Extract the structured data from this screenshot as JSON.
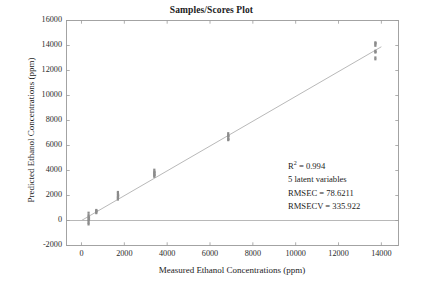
{
  "chart_data": {
    "type": "scatter",
    "title": "Samples/Scores Plot",
    "xlabel": "Measured Ethanol Concentrations (ppm)",
    "ylabel": "Predicted Ethanol Concentrations (ppm)",
    "xlim": [
      -700,
      14800
    ],
    "ylim": [
      -2000,
      16000
    ],
    "xticks": [
      0,
      2000,
      4000,
      6000,
      8000,
      10000,
      12000,
      14000
    ],
    "xtick_labels": [
      "0",
      "2000",
      "4000",
      "6000",
      "8000",
      "10000",
      "12000",
      "14000"
    ],
    "yticks": [
      -2000,
      0,
      2000,
      4000,
      6000,
      8000,
      10000,
      12000,
      14000,
      16000
    ],
    "ytick_labels": [
      "-2000",
      "0",
      "2000",
      "4000",
      "6000",
      "8000",
      "10000",
      "12000",
      "14000",
      "16000"
    ],
    "grid": false,
    "legend": null,
    "marker_color": "#8c8c8c",
    "fit_line_color": "#b9b9b9",
    "zero_line_color": "#b0b0b0",
    "axis_color": "#9a9a9a",
    "fit_line": {
      "description": "1:1 regression fit line",
      "x1": 0,
      "y1": 0,
      "x2": 14000,
      "y2": 13900
    },
    "zero_line": {
      "y": 0,
      "x_start": -700,
      "x_end": 14800
    },
    "series": [
      {
        "name": "Samples",
        "points": [
          {
            "x": 330,
            "y": 620
          },
          {
            "x": 330,
            "y": 430
          },
          {
            "x": 330,
            "y": 300
          },
          {
            "x": 330,
            "y": 170
          },
          {
            "x": 330,
            "y": 60
          },
          {
            "x": 330,
            "y": -60
          },
          {
            "x": 330,
            "y": -190
          },
          {
            "x": 330,
            "y": -310
          },
          {
            "x": 350,
            "y": 250
          },
          {
            "x": 350,
            "y": 90
          },
          {
            "x": 690,
            "y": 840
          },
          {
            "x": 690,
            "y": 740
          },
          {
            "x": 690,
            "y": 660
          },
          {
            "x": 690,
            "y": 590
          },
          {
            "x": 700,
            "y": 780
          },
          {
            "x": 1700,
            "y": 2280
          },
          {
            "x": 1700,
            "y": 2150
          },
          {
            "x": 1700,
            "y": 2000
          },
          {
            "x": 1700,
            "y": 1880
          },
          {
            "x": 1700,
            "y": 1780
          },
          {
            "x": 1700,
            "y": 1680
          },
          {
            "x": 1710,
            "y": 2060
          },
          {
            "x": 1710,
            "y": 1920
          },
          {
            "x": 3400,
            "y": 4060
          },
          {
            "x": 3400,
            "y": 3920
          },
          {
            "x": 3400,
            "y": 3800
          },
          {
            "x": 3400,
            "y": 3700
          },
          {
            "x": 3400,
            "y": 3600
          },
          {
            "x": 3400,
            "y": 3500
          },
          {
            "x": 3410,
            "y": 3860
          },
          {
            "x": 3410,
            "y": 3650
          },
          {
            "x": 6850,
            "y": 6980
          },
          {
            "x": 6850,
            "y": 6840
          },
          {
            "x": 6850,
            "y": 6700
          },
          {
            "x": 6850,
            "y": 6560
          },
          {
            "x": 6850,
            "y": 6430
          },
          {
            "x": 6860,
            "y": 6760
          },
          {
            "x": 6860,
            "y": 6500
          },
          {
            "x": 13720,
            "y": 14250
          },
          {
            "x": 13720,
            "y": 14100
          },
          {
            "x": 13720,
            "y": 13980
          },
          {
            "x": 13720,
            "y": 13580
          },
          {
            "x": 13720,
            "y": 13440
          },
          {
            "x": 13720,
            "y": 13040
          },
          {
            "x": 13720,
            "y": 12900
          },
          {
            "x": 13730,
            "y": 14180
          },
          {
            "x": 13730,
            "y": 13500
          }
        ]
      }
    ],
    "annotations": {
      "r2_prefix": "R",
      "r2_exponent": "2",
      "r2_value": " = 0.994",
      "latent_variables": "5 latent variables",
      "rmsec": "RMSEC = 78.6211",
      "rmsecv": "RMSECV = 335.922"
    }
  }
}
